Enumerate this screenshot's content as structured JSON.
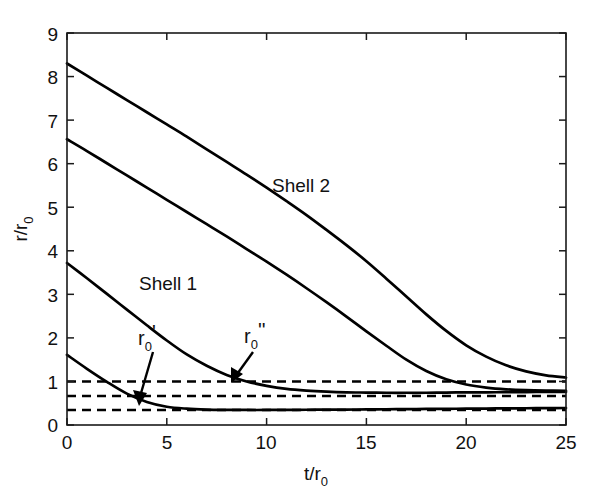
{
  "chart_data": {
    "type": "line",
    "title": "",
    "subtitle": "",
    "xlabel": "t/r0",
    "xlabel_base": "t/r",
    "xlabel_sub": "0",
    "ylabel": "r/r0",
    "ylabel_base": "r/r",
    "ylabel_sub": "0",
    "xlim": [
      0,
      25
    ],
    "ylim": [
      0,
      9
    ],
    "xticks": [
      0,
      5,
      10,
      15,
      20,
      25
    ],
    "xtick_labels": [
      "0",
      "5",
      "10",
      "15",
      "20",
      "25"
    ],
    "yticks": [
      0,
      1,
      2,
      3,
      4,
      5,
      6,
      7,
      8,
      9
    ],
    "ytick_labels": [
      "0",
      "1",
      "2",
      "3",
      "4",
      "5",
      "6",
      "7",
      "8",
      "9"
    ],
    "grid": false,
    "legend_position": "inline-annotations",
    "series": [
      {
        "name": "Shell 2 outer radius",
        "style": "solid",
        "x": [
          0,
          1,
          2,
          3,
          4,
          5,
          6,
          7,
          8,
          9,
          10,
          11,
          12,
          13,
          14,
          15,
          16,
          17,
          18,
          19,
          20,
          21,
          22,
          23,
          24,
          25
        ],
        "y": [
          8.3,
          8.02,
          7.74,
          7.46,
          7.18,
          6.9,
          6.62,
          6.33,
          6.04,
          5.75,
          5.45,
          5.14,
          4.82,
          4.48,
          4.13,
          3.76,
          3.36,
          2.95,
          2.54,
          2.16,
          1.83,
          1.57,
          1.37,
          1.23,
          1.14,
          1.09
        ]
      },
      {
        "name": "Shell 2 inner radius",
        "style": "solid",
        "x": [
          0,
          1,
          2,
          3,
          4,
          5,
          6,
          7,
          8,
          9,
          10,
          11,
          12,
          13,
          14,
          15,
          16,
          17,
          18,
          19,
          20,
          21,
          22,
          23,
          24,
          25
        ],
        "y": [
          6.56,
          6.29,
          6.01,
          5.73,
          5.45,
          5.17,
          4.89,
          4.61,
          4.33,
          4.04,
          3.75,
          3.45,
          3.14,
          2.82,
          2.49,
          2.15,
          1.82,
          1.5,
          1.24,
          1.05,
          0.93,
          0.86,
          0.82,
          0.8,
          0.79,
          0.785
        ]
      },
      {
        "name": "Shell 1 outer radius",
        "style": "solid",
        "x": [
          0,
          1,
          2,
          3,
          4,
          5,
          6,
          7,
          8,
          9,
          10,
          11,
          12,
          13,
          14,
          15,
          16,
          17,
          18,
          19,
          20,
          21,
          22,
          23,
          24,
          25
        ],
        "y": [
          3.72,
          3.37,
          3.01,
          2.65,
          2.29,
          1.94,
          1.62,
          1.36,
          1.15,
          1.0,
          0.9,
          0.83,
          0.79,
          0.765,
          0.75,
          0.745,
          0.74,
          0.74,
          0.74,
          0.745,
          0.75,
          0.75,
          0.755,
          0.755,
          0.76,
          0.76
        ]
      },
      {
        "name": "Shell 1 inner radius",
        "style": "solid",
        "x": [
          0,
          1,
          2,
          3,
          4,
          5,
          6,
          7,
          8,
          9,
          10,
          11,
          12,
          13,
          14,
          15,
          16,
          17,
          18,
          19,
          20,
          21,
          22,
          23,
          24,
          25
        ],
        "y": [
          1.61,
          1.29,
          0.99,
          0.72,
          0.53,
          0.42,
          0.375,
          0.355,
          0.348,
          0.345,
          0.345,
          0.347,
          0.35,
          0.352,
          0.355,
          0.358,
          0.362,
          0.365,
          0.368,
          0.372,
          0.375,
          0.378,
          0.381,
          0.384,
          0.387,
          0.39
        ]
      }
    ],
    "reference_lines": [
      {
        "name": "r0 unity reference",
        "y": 1.0,
        "style": "dashed",
        "x_from": 0,
        "x_to": 25
      },
      {
        "name": "r0 double prime",
        "y": 0.665,
        "style": "dashed",
        "x_from": 0,
        "x_to": 25
      },
      {
        "name": "r0 prime",
        "y": 0.344,
        "style": "dashed",
        "x_from": 0,
        "x_to": 25
      }
    ],
    "annotations": [
      {
        "name": "shell-2-label",
        "text": "Shell 2",
        "x": 10.3,
        "y": 5.75,
        "type": "series-label"
      },
      {
        "name": "shell-1-label",
        "text": "Shell 1",
        "x": 3.6,
        "y": 3.48,
        "type": "series-label"
      },
      {
        "name": "r0-prime-label",
        "text_base": "r",
        "text_sub": "0",
        "text_sup": "'",
        "x": 3.6,
        "y": 2.05,
        "type": "arrow-label",
        "arrow_to_x": 3.5,
        "arrow_to_y": 0.42
      },
      {
        "name": "r0-double-prime-label",
        "text_base": "r",
        "text_sub": "0",
        "text_sup": "''",
        "x": 9.0,
        "y": 2.1,
        "type": "arrow-label",
        "arrow_to_x": 8.3,
        "arrow_to_y": 0.96
      }
    ],
    "colors": {
      "curve": "#000000",
      "reference": "#000000",
      "axis": "#1a1a1a",
      "background": "#ffffff"
    }
  },
  "figure": {
    "x_axis_title": "t/r",
    "x_axis_subscript": "0",
    "y_axis_title": "r/r",
    "y_axis_subscript": "0",
    "shell2_label": "Shell 2",
    "shell1_label": "Shell 1",
    "r0_prime_base": "r",
    "r0_prime_sub": "0",
    "r0_prime_sup": "'",
    "r0_dprime_base": "r",
    "r0_dprime_sub": "0",
    "r0_dprime_sup": "''",
    "xt0": "0",
    "xt5": "5",
    "xt10": "10",
    "xt15": "15",
    "xt20": "20",
    "xt25": "25",
    "yt0": "0",
    "yt1": "1",
    "yt2": "2",
    "yt3": "3",
    "yt4": "4",
    "yt5": "5",
    "yt6": "6",
    "yt7": "7",
    "yt8": "8",
    "yt9": "9"
  }
}
